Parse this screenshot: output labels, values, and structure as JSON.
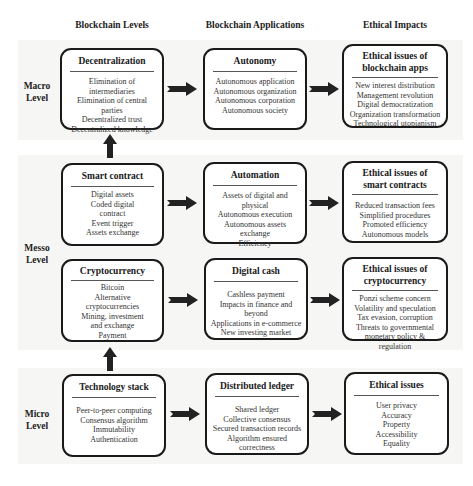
{
  "headers": {
    "levels": "Blockchain Levels",
    "applications": "Blockchain Applications",
    "impacts": "Ethical Impacts"
  },
  "level_labels": {
    "macro": [
      "Macro",
      "Level"
    ],
    "messo": [
      "Messo",
      "Level"
    ],
    "micro": [
      "Micro",
      "Level"
    ]
  },
  "rows": {
    "macro": {
      "level": {
        "title": "Decentralization",
        "items": [
          "Elimination of intermediaries",
          "Elimination of central parties",
          "Decentralized trust",
          "Decentralized knowledge"
        ]
      },
      "application": {
        "title": "Autonomy",
        "items": [
          "Autonomous application",
          "Autonomous organization",
          "Autonomous corporation",
          "Autonomous society"
        ]
      },
      "impact": {
        "title": "Ethical issues of blockchain apps",
        "items": [
          "New interest distribution",
          "Management revolution",
          "Digital democratization",
          "Organization transformation",
          "Technological utopianism"
        ]
      }
    },
    "smart": {
      "level": {
        "title": "Smart contract",
        "items": [
          "Digital assets",
          "Coded digital",
          "contract",
          "Event trigger",
          "Assets exchange"
        ]
      },
      "application": {
        "title": "Automation",
        "items": [
          "Assets of digital and physical",
          "Autonomous execution",
          "Autonomous assets exchange",
          "Efficiency"
        ]
      },
      "impact": {
        "title": "Ethical issues of smart contracts",
        "items": [
          "Reduced transaction fees",
          "Simplified procedures",
          "Promoted efficiency",
          "Autonomous models"
        ]
      }
    },
    "crypto": {
      "level": {
        "title": "Cryptocurrency",
        "items": [
          "Bitcoin",
          "Alternative",
          "cryptocurrencies",
          "Mining, investment",
          "and exchange",
          "Payment"
        ]
      },
      "application": {
        "title": "Digital cash",
        "items": [
          "Cashless payment",
          "Impacts in finance and beyond",
          "Applications in e-commerce",
          "New investing market"
        ]
      },
      "impact": {
        "title": "Ethical issues of cryptocurrency",
        "items": [
          "Ponzi scheme concern",
          "Volatility and speculation",
          "Tax evasion, corruption",
          "Threats to governmental",
          "monetary policy & regulation"
        ]
      }
    },
    "micro": {
      "level": {
        "title": "Technology stack",
        "items": [
          "Peer-to-peer computing",
          "Consensus algorithm",
          "Immutability",
          "Authentication"
        ]
      },
      "application": {
        "title": "Distributed ledger",
        "items": [
          "Shared ledger",
          "Collective consensus",
          "Secured transaction records",
          "Algorithm ensured correctness"
        ]
      },
      "impact": {
        "title": "Ethical issues",
        "items": [
          "User privacy",
          "Accuracy",
          "Property",
          "Accessibility",
          "Equality"
        ]
      }
    }
  },
  "colors": {
    "box_border": "#1a1a1a",
    "arrow": "#222222",
    "band": "#f6f6f5"
  }
}
